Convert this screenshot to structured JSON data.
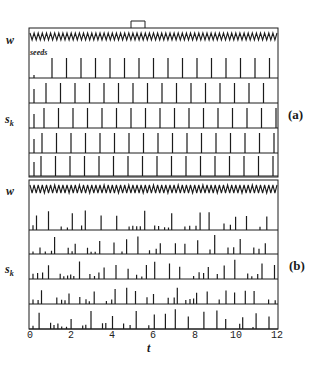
{
  "figure": {
    "panels": [
      {
        "tag": "(a)",
        "w_label": "w",
        "s_label": "s_k",
        "seeds_label": "seeds"
      },
      {
        "tag": "(b)",
        "w_label": "w",
        "s_label": "s_k"
      }
    ],
    "xaxis": {
      "label": "t",
      "ticks": [
        "0",
        "2",
        "4",
        "6",
        "8",
        "10",
        "12"
      ]
    },
    "stimulus_marker": "rectangular pulse above panel (a) near t≈5.3"
  },
  "chart_data": {
    "type": "line",
    "title": "",
    "xlabel": "t",
    "xlim": [
      0,
      12
    ],
    "xticks": [
      0,
      2,
      4,
      6,
      8,
      10,
      12
    ],
    "panels": [
      {
        "name": "(a)",
        "traces": [
          {
            "name": "w",
            "description": "fast periodic oscillation, ~5 cycles per unit t"
          },
          {
            "name": "s_k row 1 (seeds)",
            "description": "regular spike train, period ≈0.7"
          },
          {
            "name": "s_k row 2",
            "description": "regular spike train, period ≈0.7"
          },
          {
            "name": "s_k row 3",
            "description": "regular spike train, period ≈0.7"
          },
          {
            "name": "s_k row 4",
            "description": "regular spike train, period ≈0.7"
          },
          {
            "name": "s_k row 5",
            "description": "regular spike train, period ≈0.7"
          }
        ]
      },
      {
        "name": "(b)",
        "traces": [
          {
            "name": "w",
            "description": "fast periodic oscillation"
          },
          {
            "name": "s_k row 1",
            "description": "irregular spikes, small amplitude early, larger after t≈2"
          },
          {
            "name": "s_k row 2",
            "description": "irregular spikes of varying height"
          },
          {
            "name": "s_k row 3",
            "description": "irregular spikes of varying height"
          },
          {
            "name": "s_k row 4",
            "description": "irregular spikes of varying height"
          },
          {
            "name": "s_k row 5",
            "description": "irregular spikes of varying height"
          }
        ]
      }
    ],
    "ylabels": [
      "w",
      "s_k"
    ]
  }
}
